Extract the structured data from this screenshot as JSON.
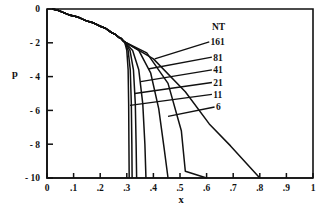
{
  "chart_data": {
    "type": "line",
    "title": "",
    "xlabel": "x",
    "ylabel": "p",
    "xlim": [
      0,
      1
    ],
    "ylim": [
      -10,
      0
    ],
    "grid": false,
    "legend_position": "inside-right",
    "legend_title": "NT",
    "x_ticks": [
      0,
      0.1,
      0.2,
      0.3,
      0.4,
      0.5,
      0.6,
      0.7,
      0.8,
      0.9,
      1
    ],
    "x_tick_labels": [
      "0",
      ".1",
      ".2",
      ".3",
      ".4",
      ".5",
      ".6",
      ".7",
      ".8",
      ".9",
      "1"
    ],
    "y_ticks": [
      0,
      -2,
      -4,
      -6,
      -8,
      -10
    ],
    "y_tick_labels": [
      "0",
      "- 2",
      "- 4",
      "- 6",
      "- 8",
      "- 10"
    ],
    "line_color": "#111111",
    "series": [
      {
        "name": "161",
        "label": "161",
        "x": [
          0.02,
          0.1,
          0.16,
          0.21,
          0.25,
          0.275,
          0.292,
          0.3,
          0.305,
          0.307,
          0.308,
          0.309
        ],
        "y": [
          0.0,
          -0.42,
          -0.75,
          -1.08,
          -1.45,
          -1.72,
          -1.95,
          -2.45,
          -3.6,
          -5.6,
          -8.0,
          -10.0
        ]
      },
      {
        "name": "81",
        "label": "81",
        "x": [
          0.02,
          0.1,
          0.16,
          0.21,
          0.25,
          0.275,
          0.292,
          0.305,
          0.313,
          0.317,
          0.319,
          0.32
        ],
        "y": [
          0.0,
          -0.42,
          -0.75,
          -1.08,
          -1.45,
          -1.72,
          -1.95,
          -2.45,
          -3.6,
          -5.6,
          -8.0,
          -10.0
        ]
      },
      {
        "name": "41",
        "label": "41",
        "x": [
          0.02,
          0.1,
          0.16,
          0.21,
          0.25,
          0.275,
          0.292,
          0.312,
          0.325,
          0.332,
          0.335,
          0.337
        ],
        "y": [
          0.0,
          -0.42,
          -0.75,
          -1.08,
          -1.45,
          -1.72,
          -1.95,
          -2.45,
          -3.6,
          -5.6,
          -8.0,
          -10.0
        ]
      },
      {
        "name": "21",
        "label": "21",
        "x": [
          0.02,
          0.1,
          0.16,
          0.21,
          0.25,
          0.275,
          0.292,
          0.322,
          0.345,
          0.36,
          0.368,
          0.372
        ],
        "y": [
          0.0,
          -0.42,
          -0.75,
          -1.08,
          -1.45,
          -1.72,
          -1.95,
          -2.45,
          -3.6,
          -5.6,
          -8.0,
          -10.0
        ]
      },
      {
        "name": "11",
        "label": "11",
        "x": [
          0.02,
          0.1,
          0.16,
          0.21,
          0.25,
          0.275,
          0.292,
          0.345,
          0.39,
          0.42,
          0.44,
          0.455
        ],
        "y": [
          0.0,
          -0.42,
          -0.75,
          -1.08,
          -1.45,
          -1.72,
          -1.95,
          -2.45,
          -3.8,
          -5.9,
          -8.2,
          -10.0
        ]
      },
      {
        "name": "6",
        "label": "6",
        "x": [
          0.02,
          0.1,
          0.16,
          0.21,
          0.25,
          0.275,
          0.292,
          0.375,
          0.455,
          0.505,
          0.52,
          0.6
        ],
        "y": [
          0.0,
          -0.42,
          -0.75,
          -1.08,
          -1.45,
          -1.72,
          -1.95,
          -2.6,
          -4.4,
          -7.2,
          -9.6,
          -10.0
        ]
      },
      {
        "name": "NT",
        "label": "NT",
        "x": [
          0.02,
          0.1,
          0.16,
          0.21,
          0.25,
          0.275,
          0.292,
          0.4,
          0.52,
          0.61,
          0.69,
          0.8
        ],
        "y": [
          0.0,
          -0.42,
          -0.75,
          -1.08,
          -1.45,
          -1.72,
          -1.95,
          -2.95,
          -4.9,
          -6.8,
          -8.1,
          -10.0
        ]
      }
    ],
    "annotations": [
      {
        "text": "NT",
        "x": 0.62,
        "y": -1.05,
        "is_header": true
      },
      {
        "text": "161",
        "x": 0.615,
        "y": -1.95,
        "is_header": false
      },
      {
        "text": "81",
        "x": 0.625,
        "y": -2.85,
        "is_header": false
      },
      {
        "text": "41",
        "x": 0.625,
        "y": -3.6,
        "is_header": false
      },
      {
        "text": "21",
        "x": 0.625,
        "y": -4.35,
        "is_header": false
      },
      {
        "text": "11",
        "x": 0.625,
        "y": -5.05,
        "is_header": false
      },
      {
        "text": "6",
        "x": 0.635,
        "y": -5.8,
        "is_header": false
      }
    ]
  }
}
